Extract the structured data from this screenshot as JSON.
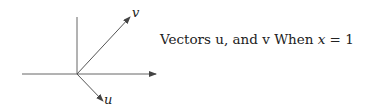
{
  "diagram": {
    "caption_prefix": "Vectors u, and v When ",
    "caption_var": "x",
    "caption_rel": " = ",
    "caption_value": "1",
    "vectors": [
      {
        "name": "u",
        "label": "u"
      },
      {
        "name": "v",
        "label": "v"
      }
    ],
    "colors": {
      "stroke": "#555555",
      "text": "#222222"
    }
  }
}
